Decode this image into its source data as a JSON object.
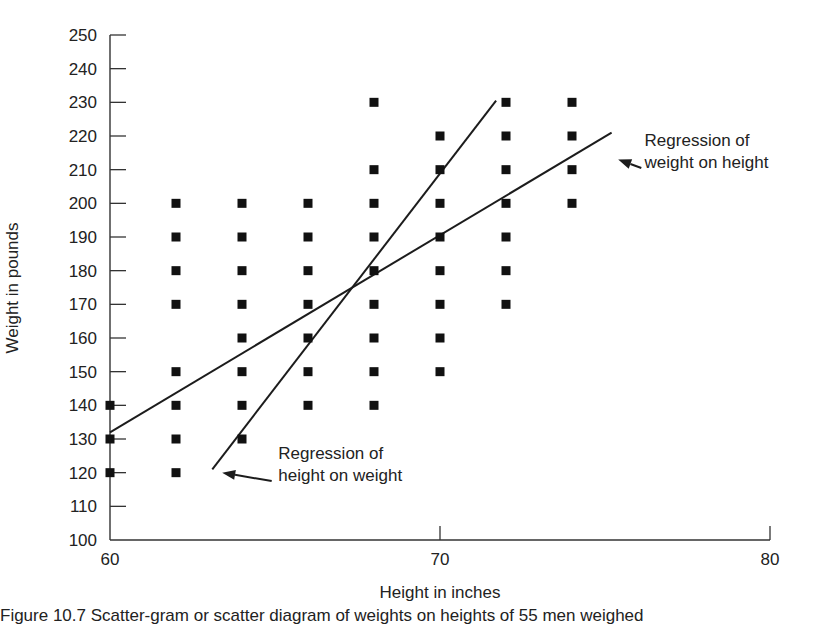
{
  "chart_data": {
    "type": "scatter",
    "title": "",
    "xlabel": "Height in inches",
    "ylabel": "Weight in pounds",
    "xlim": [
      60,
      80
    ],
    "ylim": [
      100,
      250
    ],
    "x_ticks": [
      60,
      70,
      80
    ],
    "y_ticks": [
      100,
      110,
      120,
      130,
      140,
      150,
      160,
      170,
      180,
      190,
      200,
      210,
      220,
      230,
      240,
      250
    ],
    "grid": false,
    "legend": null,
    "series": [
      {
        "name": "observations",
        "marker": "square",
        "points": [
          [
            60,
            140
          ],
          [
            60,
            130
          ],
          [
            60,
            120
          ],
          [
            62,
            200
          ],
          [
            62,
            190
          ],
          [
            62,
            180
          ],
          [
            62,
            170
          ],
          [
            62,
            150
          ],
          [
            62,
            140
          ],
          [
            62,
            130
          ],
          [
            62,
            120
          ],
          [
            64,
            200
          ],
          [
            64,
            190
          ],
          [
            64,
            180
          ],
          [
            64,
            170
          ],
          [
            64,
            160
          ],
          [
            64,
            150
          ],
          [
            64,
            140
          ],
          [
            64,
            130
          ],
          [
            66,
            200
          ],
          [
            66,
            190
          ],
          [
            66,
            180
          ],
          [
            66,
            170
          ],
          [
            66,
            160
          ],
          [
            66,
            150
          ],
          [
            66,
            140
          ],
          [
            68,
            230
          ],
          [
            68,
            210
          ],
          [
            68,
            200
          ],
          [
            68,
            190
          ],
          [
            68,
            180
          ],
          [
            68,
            170
          ],
          [
            68,
            160
          ],
          [
            68,
            150
          ],
          [
            68,
            140
          ],
          [
            70,
            220
          ],
          [
            70,
            210
          ],
          [
            70,
            200
          ],
          [
            70,
            190
          ],
          [
            70,
            180
          ],
          [
            70,
            170
          ],
          [
            70,
            160
          ],
          [
            70,
            150
          ],
          [
            72,
            230
          ],
          [
            72,
            220
          ],
          [
            72,
            210
          ],
          [
            72,
            200
          ],
          [
            72,
            190
          ],
          [
            72,
            180
          ],
          [
            72,
            170
          ],
          [
            74,
            230
          ],
          [
            74,
            220
          ],
          [
            74,
            210
          ],
          [
            74,
            200
          ]
        ]
      }
    ],
    "lines": [
      {
        "name": "Regression of weight on height",
        "from": [
          60,
          132
        ],
        "to": [
          75.2,
          221
        ]
      },
      {
        "name": "Regression of height on weight",
        "from": [
          63.1,
          121
        ],
        "to": [
          71.7,
          230.5
        ]
      }
    ],
    "annotations": [
      {
        "lines": [
          "Regression of",
          "weight on height"
        ],
        "text_at": [
          76.2,
          217
        ],
        "arrow_from": [
          76.1,
          210.5
        ],
        "arrow_to": [
          75.4,
          213
        ]
      },
      {
        "lines": [
          "Regression of",
          "height on weight"
        ],
        "text_at": [
          65.1,
          124
        ],
        "arrow_from": [
          64.9,
          117.5
        ],
        "arrow_to": [
          63.4,
          120
        ]
      }
    ]
  },
  "caption": {
    "text": "Figure 10.7 Scatter-gram or scatter diagram of weights on heights of 55 men weighed"
  }
}
